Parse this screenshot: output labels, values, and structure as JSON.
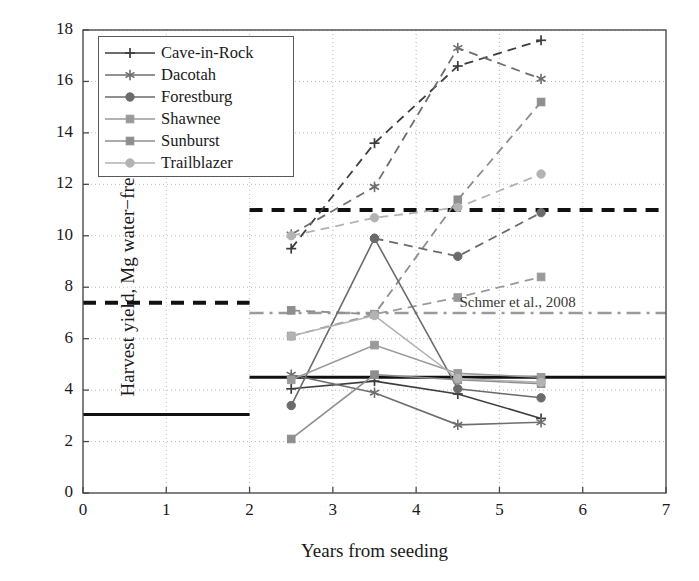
{
  "chart_data": {
    "type": "line",
    "title": "",
    "xlabel": "Years from seeding",
    "ylabel": "Harvest yield, Mg water−free/ha",
    "xlim": [
      0,
      7
    ],
    "ylim": [
      0,
      18
    ],
    "xticks": [
      "0",
      "1",
      "2",
      "3",
      "4",
      "5",
      "6",
      "7"
    ],
    "yticks": [
      "0",
      "2",
      "4",
      "6",
      "8",
      "10",
      "12",
      "14",
      "16",
      "18"
    ],
    "grid": "dotted-both",
    "legend_position": "upper-left-inside",
    "x": [
      2.5,
      3.5,
      4.5,
      5.5
    ],
    "series": [
      {
        "name": "Cave-in-Rock",
        "marker": "plus",
        "color": "#3d3d3d",
        "values": [
          4.05,
          4.35,
          3.85,
          2.9
        ]
      },
      {
        "name": "Dacotah",
        "marker": "star",
        "color": "#6e6e6e",
        "values": [
          4.6,
          3.9,
          2.65,
          2.75
        ]
      },
      {
        "name": "Forestburg",
        "marker": "circle",
        "color": "#6b6b6b",
        "values": [
          3.4,
          9.9,
          4.05,
          3.7
        ]
      },
      {
        "name": "Shawnee",
        "marker": "square",
        "color": "#9a9a9a",
        "values": [
          4.4,
          5.75,
          4.65,
          4.5
        ]
      },
      {
        "name": "Sunburst",
        "marker": "square",
        "color": "#8e8e8e",
        "values": [
          2.1,
          4.6,
          4.4,
          4.25
        ]
      },
      {
        "name": "Trailblazer",
        "marker": "circle",
        "color": "#b3b3b3",
        "values": [
          6.1,
          6.9,
          4.45,
          4.3
        ]
      }
    ],
    "upper_series": [
      {
        "name": "Cave-in-Rock",
        "marker": "plus",
        "color": "#3d3d3d",
        "linestyle": "dashed",
        "x": [
          2.5,
          3.5,
          4.5,
          5.5
        ],
        "values": [
          9.5,
          13.6,
          16.6,
          17.6
        ]
      },
      {
        "name": "Dacotah",
        "marker": "star",
        "color": "#6e6e6e",
        "linestyle": "dashed",
        "x": [
          2.5,
          3.5,
          4.5,
          5.5
        ],
        "values": [
          10.05,
          11.9,
          17.3,
          16.1
        ]
      },
      {
        "name": "Sunburst",
        "marker": "square",
        "color": "#8e8e8e",
        "linestyle": "dashed",
        "x": [
          2.5,
          3.5,
          4.5,
          5.5
        ],
        "values": [
          7.1,
          6.95,
          11.4,
          15.2
        ]
      },
      {
        "name": "Trailblazer",
        "marker": "circle",
        "color": "#b3b3b3",
        "linestyle": "dashed",
        "x": [
          2.5,
          3.5,
          4.5,
          5.5
        ],
        "values": [
          10.0,
          10.7,
          11.1,
          12.4
        ]
      },
      {
        "name": "Forestburg",
        "marker": "circle",
        "color": "#6b6b6b",
        "linestyle": "dashed",
        "x": [
          3.5,
          4.5,
          5.5
        ],
        "values": [
          9.9,
          9.2,
          10.9
        ]
      },
      {
        "name": "Shawnee",
        "marker": "square",
        "color": "#9a9a9a",
        "linestyle": "dashed",
        "x": [
          2.5,
          3.5,
          4.5,
          5.5
        ],
        "values": [
          6.1,
          6.95,
          7.6,
          8.4
        ]
      }
    ],
    "reference_lines": [
      {
        "name": "low-baseline-left",
        "y": 3.05,
        "x0": 0,
        "x1": 2,
        "color": "#111111",
        "style": "solid",
        "width": 3
      },
      {
        "name": "high-baseline-left",
        "y": 7.4,
        "x0": 0,
        "x1": 2,
        "color": "#111111",
        "style": "dashed",
        "width": 4
      },
      {
        "name": "low-baseline-right",
        "y": 4.5,
        "x0": 2,
        "x1": 7,
        "color": "#111111",
        "style": "solid",
        "width": 3
      },
      {
        "name": "high-baseline-right",
        "y": 11.0,
        "x0": 2,
        "x1": 7,
        "color": "#111111",
        "style": "dashed",
        "width": 4
      },
      {
        "name": "schmer-reference",
        "y": 7.0,
        "x0": 2,
        "x1": 7,
        "color": "#9a9a9a",
        "style": "dashdot",
        "width": 2.5
      }
    ],
    "annotations": [
      {
        "name": "schmer-label",
        "text": "Schmer et al., 2008",
        "x": 5.0,
        "y": 7.35
      }
    ]
  },
  "legend": {
    "items": [
      {
        "label": "Cave-in-Rock"
      },
      {
        "label": "Dacotah"
      },
      {
        "label": "Forestburg"
      },
      {
        "label": "Shawnee"
      },
      {
        "label": "Sunburst"
      },
      {
        "label": "Trailblazer"
      }
    ]
  }
}
